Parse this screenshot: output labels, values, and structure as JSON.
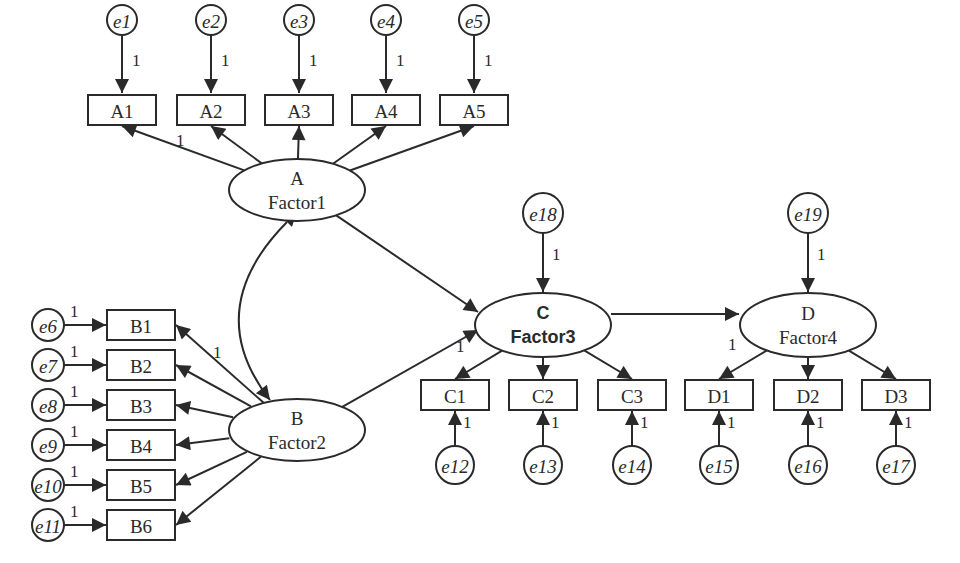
{
  "diagram": {
    "type": "structural-equation-model",
    "latent_factors": [
      {
        "id": "A",
        "letter": "A",
        "name": "Factor1"
      },
      {
        "id": "B",
        "letter": "B",
        "name": "Factor2"
      },
      {
        "id": "C",
        "letter": "C",
        "name": "Factor3"
      },
      {
        "id": "D",
        "letter": "D",
        "name": "Factor4"
      }
    ],
    "indicators": {
      "A": [
        "A1",
        "A2",
        "A3",
        "A4",
        "A5"
      ],
      "B": [
        "B1",
        "B2",
        "B3",
        "B4",
        "B5",
        "B6"
      ],
      "C": [
        "C1",
        "C2",
        "C3"
      ],
      "D": [
        "D1",
        "D2",
        "D3"
      ]
    },
    "errors": {
      "A": [
        "e1",
        "e2",
        "e3",
        "e4",
        "e5"
      ],
      "B": [
        "e6",
        "e7",
        "e8",
        "e9",
        "e10",
        "e11"
      ],
      "C": [
        "e12",
        "e13",
        "e14"
      ],
      "D": [
        "e15",
        "e16",
        "e17"
      ],
      "disturbance_C": "e18",
      "disturbance_D": "e19"
    },
    "fixed_loading": "1",
    "paths": [
      {
        "from": "A",
        "to": "C"
      },
      {
        "from": "B",
        "to": "C"
      },
      {
        "from": "C",
        "to": "D"
      },
      {
        "from": "A",
        "to": "B",
        "type": "covariance"
      }
    ]
  }
}
